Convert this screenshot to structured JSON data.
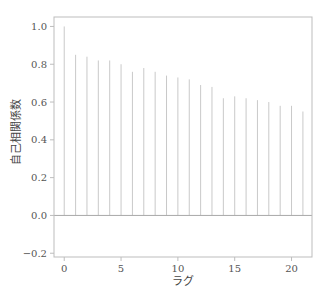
{
  "chart_data": {
    "type": "bar",
    "subtype": "stem",
    "title": "",
    "xlabel": "ラグ",
    "ylabel": "自己相関係数",
    "x": [
      0,
      1,
      2,
      3,
      4,
      5,
      6,
      7,
      8,
      9,
      10,
      11,
      12,
      13,
      14,
      15,
      16,
      17,
      18,
      19,
      20,
      21
    ],
    "values": [
      1.0,
      0.85,
      0.84,
      0.82,
      0.82,
      0.8,
      0.76,
      0.78,
      0.76,
      0.74,
      0.73,
      0.72,
      0.69,
      0.68,
      0.62,
      0.63,
      0.62,
      0.61,
      0.6,
      0.58,
      0.58,
      0.55
    ],
    "xlim": [
      -0.9,
      21.8
    ],
    "ylim": [
      -0.22,
      1.05
    ],
    "xticks": [
      0,
      5,
      10,
      15,
      20
    ],
    "xtick_labels": [
      "0",
      "5",
      "10",
      "15",
      "20"
    ],
    "yticks": [
      -0.2,
      0.0,
      0.2,
      0.4,
      0.6,
      0.8,
      1.0
    ],
    "ytick_labels": [
      "−0.2",
      "0.0",
      "0.2",
      "0.4",
      "0.6",
      "0.8",
      "1.0"
    ],
    "grid": false,
    "legend": null,
    "zero_line": true
  },
  "colors": {
    "stem": "#c9c9c9",
    "zero_line": "#a8a8a8",
    "frame": "#bdbdbd",
    "tick_text": "#555555"
  }
}
